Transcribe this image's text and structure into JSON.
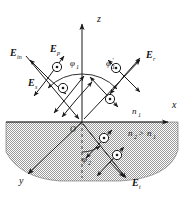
{
  "figure": {
    "type": "optics-reflection-refraction-diagram",
    "background": "#ffffff",
    "line_color": "#1a1a1a",
    "medium_fill": "#b9b9b9"
  },
  "axes": {
    "z": {
      "label": "z",
      "x": 100,
      "y": 18
    },
    "x": {
      "label": "x",
      "x": 174,
      "y": 104
    },
    "y": {
      "label": "y",
      "x": 22,
      "y": 180
    },
    "origin": {
      "label": "O",
      "x": 72,
      "y": 126
    }
  },
  "media": {
    "upper": {
      "label": "n",
      "sub": "1",
      "x": 134,
      "y": 110
    },
    "lower": {
      "label": "n",
      "sub": "2",
      "relation": ">",
      "label2": "n",
      "sub2": "1",
      "x": 130,
      "y": 132
    }
  },
  "angles": [
    {
      "name": "phi-incident",
      "label": "φ",
      "sub": "1",
      "prime": "",
      "x": 76,
      "y": 62
    },
    {
      "name": "phi-reflected",
      "label": "φ",
      "sub": "1",
      "prime": "′",
      "x": 112,
      "y": 62
    },
    {
      "name": "phi-transmitted",
      "label": "φ",
      "sub": "2",
      "prime": "",
      "x": 86,
      "y": 158
    }
  ],
  "field_labels": [
    {
      "name": "E-incident",
      "label": "E",
      "sub": "in",
      "x": 14,
      "y": 52
    },
    {
      "name": "E-p-incident",
      "label": "E",
      "sub": "p",
      "x": 52,
      "y": 50
    },
    {
      "name": "E-s-incident",
      "label": "E",
      "sub": "s",
      "x": 32,
      "y": 82
    },
    {
      "name": "E-reflected",
      "label": "E",
      "sub": "r",
      "x": 148,
      "y": 54
    },
    {
      "name": "E-transmitted",
      "label": "E",
      "sub": "t",
      "x": 134,
      "y": 182
    }
  ],
  "rays": [
    {
      "name": "incident-ray",
      "from": [
        30,
        60
      ],
      "to": [
        82,
        122
      ]
    },
    {
      "name": "reflected-ray",
      "from": [
        82,
        122
      ],
      "to": [
        142,
        62
      ]
    },
    {
      "name": "transmitted-ray",
      "from": [
        82,
        122
      ],
      "to": [
        128,
        180
      ]
    },
    {
      "name": "y-axis-ray",
      "from": [
        82,
        122
      ],
      "to": [
        26,
        176
      ]
    }
  ]
}
